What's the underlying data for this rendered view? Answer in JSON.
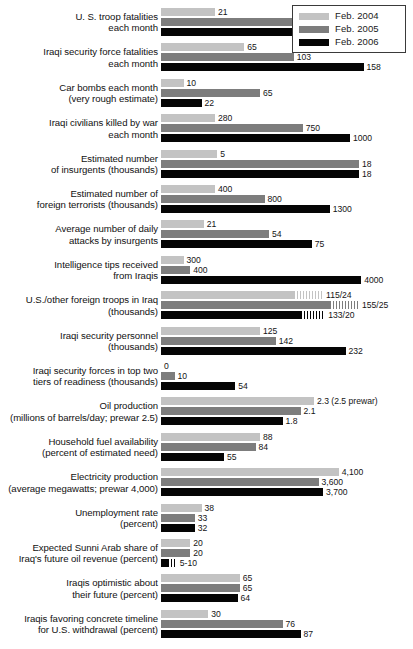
{
  "legend": {
    "position": "top-right",
    "entries": [
      {
        "label": "Feb. 2004",
        "color": "#c3c3c3",
        "key": "2004"
      },
      {
        "label": "Feb. 2005",
        "color": "#7d7d7d",
        "key": "2005"
      },
      {
        "label": "Feb. 2006",
        "color": "#050505",
        "key": "2006"
      }
    ]
  },
  "chart_data": {
    "type": "bar",
    "title": "",
    "subtitle": "",
    "xlabel": "",
    "ylabel": "",
    "orientation": "horizontal",
    "grid": false,
    "legend_position": "top-right",
    "note": "Each metric row is scaled independently; bar lengths are relative within a row.",
    "series": [
      {
        "name": "Feb. 2004",
        "color": "#c3c3c3"
      },
      {
        "name": "Feb. 2005",
        "color": "#7d7d7d"
      },
      {
        "name": "Feb. 2006",
        "color": "#050505"
      }
    ],
    "categories": [
      "U. S. troop fatalities each month",
      "Iraqi security force fatalities each month",
      "Car bombs each month (very rough estimate)",
      "Iraqi civilians killed by war each month",
      "Estimated number of insurgents (thousands)",
      "Estimated number of foreign terrorists (thousands)",
      "Average number of daily attacks by insurgents",
      "Intelligence tips received from Iraqis",
      "U.S./other foreign troops in Iraq (thousands)",
      "Iraqi security personnel (thousands)",
      "Iraqi security forces in top two tiers of readiness (thousands)",
      "Oil production (millions of barrels/day; prewar 2.5)",
      "Household fuel availability (percent of estimated need)",
      "Electricity production (average megawatts; prewar 4,000)",
      "Unemployment rate (percent)",
      "Expected Sunni Arab share of Iraq's future oil revenue (percent)",
      "Iraqis optimistic about their future (percent)",
      "Iraqis favoring concrete timeline for U.S. withdrawal (percent)"
    ],
    "rows": [
      {
        "id": "us-troop-fatalities",
        "label_lines": [
          "U. S. troop fatalities",
          "each month"
        ],
        "bars": [
          {
            "series": "2004",
            "value": 21,
            "value_text": "21",
            "len_pct": 24
          },
          {
            "series": "2005",
            "value": 56,
            "value_text": "56",
            "len_pct": 65
          },
          {
            "series": "2006",
            "value": 54,
            "value_text": "54",
            "len_pct": 62
          }
        ]
      },
      {
        "id": "iraqi-security-force-fatalities",
        "label_lines": [
          "Iraqi security force fatalities",
          "each month"
        ],
        "bars": [
          {
            "series": "2004",
            "value": 65,
            "value_text": "65",
            "len_pct": 37
          },
          {
            "series": "2005",
            "value": 103,
            "value_text": "103",
            "len_pct": 59
          },
          {
            "series": "2006",
            "value": 158,
            "value_text": "158",
            "len_pct": 90
          }
        ]
      },
      {
        "id": "car-bombs",
        "label_lines": [
          "Car bombs each month",
          "(very rough estimate)"
        ],
        "bars": [
          {
            "series": "2004",
            "value": 10,
            "value_text": "10",
            "len_pct": 10
          },
          {
            "series": "2005",
            "value": 65,
            "value_text": "65",
            "len_pct": 44
          },
          {
            "series": "2006",
            "value": 22,
            "value_text": "22",
            "len_pct": 18
          }
        ]
      },
      {
        "id": "iraqi-civilians-killed",
        "label_lines": [
          "Iraqi civilians killed by war",
          "each month"
        ],
        "bars": [
          {
            "series": "2004",
            "value": 280,
            "value_text": "280",
            "len_pct": 24
          },
          {
            "series": "2005",
            "value": 750,
            "value_text": "750",
            "len_pct": 63
          },
          {
            "series": "2006",
            "value": 1000,
            "value_text": "1000",
            "len_pct": 84
          }
        ]
      },
      {
        "id": "estimated-insurgents",
        "label_lines": [
          "Estimated number",
          "of insurgents (thousands)"
        ],
        "bars": [
          {
            "series": "2004",
            "value": 5,
            "value_text": "5",
            "len_pct": 25
          },
          {
            "series": "2005",
            "value": 18,
            "value_text": "18",
            "len_pct": 88
          },
          {
            "series": "2006",
            "value": 18,
            "value_text": "18",
            "len_pct": 88
          }
        ]
      },
      {
        "id": "foreign-terrorists",
        "label_lines": [
          "Estimated number of",
          "foreign terrorists (thousands)"
        ],
        "bars": [
          {
            "series": "2004",
            "value": 400,
            "value_text": "400",
            "len_pct": 24
          },
          {
            "series": "2005",
            "value": 800,
            "value_text": "800",
            "len_pct": 46
          },
          {
            "series": "2006",
            "value": 1300,
            "value_text": "1300",
            "len_pct": 75
          }
        ]
      },
      {
        "id": "daily-attacks",
        "label_lines": [
          "Average number of daily",
          "attacks by insurgents"
        ],
        "bars": [
          {
            "series": "2004",
            "value": 21,
            "value_text": "21",
            "len_pct": 19
          },
          {
            "series": "2005",
            "value": 54,
            "value_text": "54",
            "len_pct": 48
          },
          {
            "series": "2006",
            "value": 75,
            "value_text": "75",
            "len_pct": 67
          }
        ]
      },
      {
        "id": "intelligence-tips",
        "label_lines": [
          "Intelligence tips received",
          "from Iraqis"
        ],
        "bars": [
          {
            "series": "2004",
            "value": 300,
            "value_text": "300",
            "len_pct": 10
          },
          {
            "series": "2005",
            "value": 400,
            "value_text": "400",
            "len_pct": 13
          },
          {
            "series": "2006",
            "value": 4000,
            "value_text": "4000",
            "len_pct": 89
          }
        ]
      },
      {
        "id": "us-other-foreign-troops",
        "label_lines": [
          "U.S./other foreign troops in Iraq",
          "(thousands)"
        ],
        "bars": [
          {
            "series": "2004",
            "value": 115,
            "other": 24,
            "value_text": "115/24",
            "len_pct": 59,
            "hatch_pct": 13
          },
          {
            "series": "2005",
            "value": 155,
            "other": 25,
            "value_text": "155/25",
            "len_pct": 75,
            "hatch_pct": 13
          },
          {
            "series": "2006",
            "value": 133,
            "other": 20,
            "value_text": "133/20",
            "len_pct": 62,
            "hatch_pct": 11
          }
        ]
      },
      {
        "id": "iraqi-security-personnel",
        "label_lines": [
          "Iraqi security personnel",
          "(thousands)"
        ],
        "bars": [
          {
            "series": "2004",
            "value": 125,
            "value_text": "125",
            "len_pct": 44
          },
          {
            "series": "2005",
            "value": 142,
            "value_text": "142",
            "len_pct": 51
          },
          {
            "series": "2006",
            "value": 232,
            "value_text": "232",
            "len_pct": 82
          }
        ]
      },
      {
        "id": "security-forces-readiness",
        "label_lines": [
          "Iraqi security forces in top two",
          "tiers of readiness (thousands)"
        ],
        "bars": [
          {
            "series": "2004",
            "value": 0,
            "value_text": "0",
            "len_pct": 0
          },
          {
            "series": "2005",
            "value": 10,
            "value_text": "10",
            "len_pct": 6
          },
          {
            "series": "2006",
            "value": 54,
            "value_text": "54",
            "len_pct": 33
          }
        ]
      },
      {
        "id": "oil-production",
        "label_lines": [
          "Oil production",
          "(millions of barrels/day; prewar 2.5)"
        ],
        "bars": [
          {
            "series": "2004",
            "value": 2.3,
            "value_text": "2.3 (2.5 prewar)",
            "len_pct": 68
          },
          {
            "series": "2005",
            "value": 2.1,
            "value_text": "2.1",
            "len_pct": 62
          },
          {
            "series": "2006",
            "value": 1.8,
            "value_text": "1.8",
            "len_pct": 54
          }
        ]
      },
      {
        "id": "household-fuel",
        "label_lines": [
          "Household fuel availability",
          "(percent of estimated need)"
        ],
        "bars": [
          {
            "series": "2004",
            "value": 88,
            "value_text": "88",
            "len_pct": 44
          },
          {
            "series": "2005",
            "value": 84,
            "value_text": "84",
            "len_pct": 42
          },
          {
            "series": "2006",
            "value": 55,
            "value_text": "55",
            "len_pct": 28
          }
        ]
      },
      {
        "id": "electricity-production",
        "label_lines": [
          "Electricity production",
          "(average megawatts; prewar 4,000)"
        ],
        "bars": [
          {
            "series": "2004",
            "value": 4100,
            "value_text": "4,100",
            "len_pct": 79
          },
          {
            "series": "2005",
            "value": 3600,
            "value_text": "3,600",
            "len_pct": 70
          },
          {
            "series": "2006",
            "value": 3700,
            "value_text": "3,700",
            "len_pct": 72
          }
        ]
      },
      {
        "id": "unemployment-rate",
        "label_lines": [
          "Unemployment  rate",
          "(percent)"
        ],
        "bars": [
          {
            "series": "2004",
            "value": 38,
            "value_text": "38",
            "len_pct": 18
          },
          {
            "series": "2005",
            "value": 33,
            "value_text": "33",
            "len_pct": 15
          },
          {
            "series": "2006",
            "value": 32,
            "value_text": "32",
            "len_pct": 15
          }
        ]
      },
      {
        "id": "sunni-oil-revenue-share",
        "label_lines": [
          "Expected Sunni Arab share of",
          "Iraq's future oil revenue (percent)"
        ],
        "bars": [
          {
            "series": "2004",
            "value": 20,
            "value_text": "20",
            "len_pct": 13
          },
          {
            "series": "2005",
            "value": 20,
            "value_text": "20",
            "len_pct": 13
          },
          {
            "series": "2006",
            "value": "5-10",
            "value_text": "5-10",
            "len_pct": 3,
            "hatch_pct": 4
          }
        ]
      },
      {
        "id": "iraqis-optimistic",
        "label_lines": [
          "Iraqis optimistic about",
          "their future (percent)"
        ],
        "bars": [
          {
            "series": "2004",
            "value": 65,
            "value_text": "65",
            "len_pct": 35
          },
          {
            "series": "2005",
            "value": 65,
            "value_text": "65",
            "len_pct": 35
          },
          {
            "series": "2006",
            "value": 64,
            "value_text": "64",
            "len_pct": 34
          }
        ]
      },
      {
        "id": "iraqis-favoring-timeline",
        "label_lines": [
          "Iraqis favoring concrete timeline",
          "for U.S. withdrawal (percent)"
        ],
        "bars": [
          {
            "series": "2004",
            "value": 30,
            "value_text": "30",
            "len_pct": 21
          },
          {
            "series": "2005",
            "value": 76,
            "value_text": "76",
            "len_pct": 54
          },
          {
            "series": "2006",
            "value": 87,
            "value_text": "87",
            "len_pct": 62
          }
        ]
      }
    ]
  }
}
